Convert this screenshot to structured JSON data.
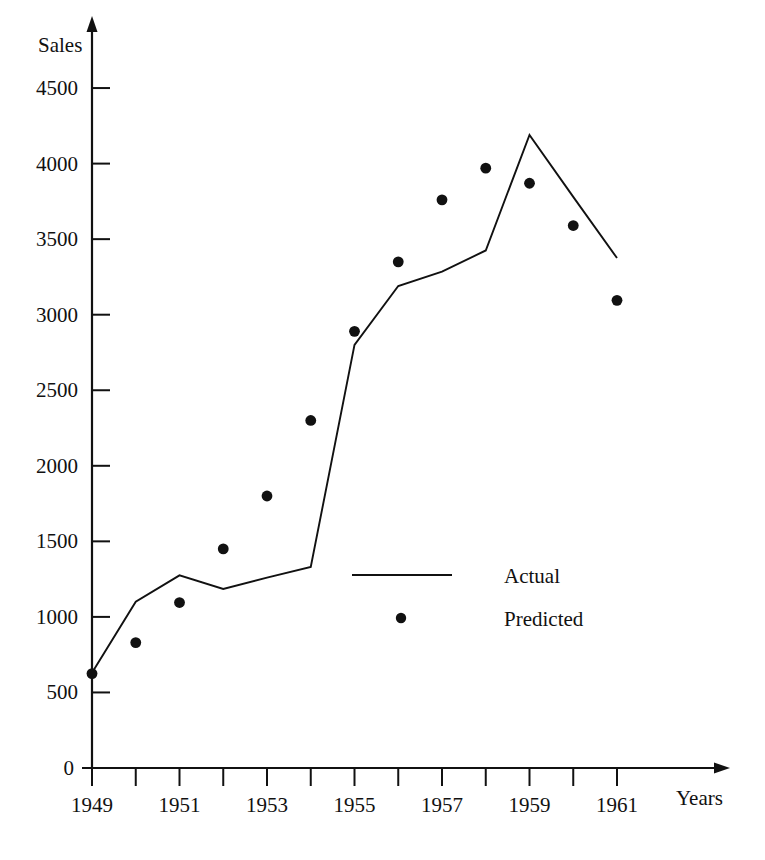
{
  "chart_data": {
    "type": "line",
    "title": "",
    "xlabel": "Years",
    "ylabel": "Sales",
    "x": [
      1949,
      1950,
      1951,
      1952,
      1953,
      1954,
      1955,
      1956,
      1957,
      1958,
      1959,
      1960,
      1961
    ],
    "xlim": [
      1949,
      1961
    ],
    "ylim": [
      0,
      4500
    ],
    "grid": false,
    "legend_position": "center",
    "y_ticks": [
      0,
      500,
      1000,
      1500,
      2000,
      2500,
      3000,
      3500,
      4000,
      4500
    ],
    "y_tick_labels": [
      "0",
      "500",
      "1000",
      "1500",
      "2000",
      "2500",
      "3000",
      "3500",
      "4000",
      "4500"
    ],
    "x_ticks": [
      1949,
      1950,
      1951,
      1952,
      1953,
      1954,
      1955,
      1956,
      1957,
      1958,
      1959,
      1960,
      1961
    ],
    "x_tick_labels": [
      "1949",
      "",
      "1951",
      "",
      "1953",
      "",
      "1955",
      "",
      "1957",
      "",
      "1959",
      "",
      "1961"
    ],
    "series": [
      {
        "name": "Actual",
        "marker": "line",
        "values": [
          630,
          1100,
          1275,
          1185,
          1260,
          1330,
          2800,
          3190,
          3285,
          3425,
          4190,
          3780,
          3375
        ]
      },
      {
        "name": "Predicted",
        "marker": "dot",
        "values": [
          625,
          830,
          1095,
          1450,
          1800,
          2300,
          2890,
          3350,
          3760,
          3970,
          3870,
          3590,
          3095
        ]
      }
    ]
  },
  "legend": {
    "entries": [
      {
        "label": "Actual",
        "marker": "line"
      },
      {
        "label": "Predicted",
        "marker": "dot"
      }
    ]
  },
  "axes": {
    "y_axis_title": "Sales",
    "x_axis_title": "Years"
  },
  "colors": {
    "ink": "#111111",
    "background": "#ffffff"
  }
}
